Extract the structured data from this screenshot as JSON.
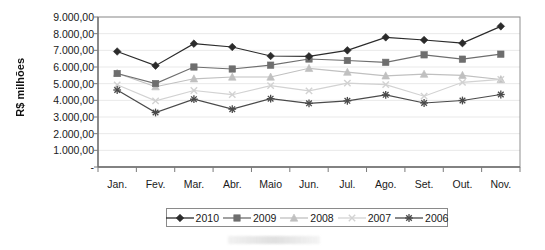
{
  "chart_data": {
    "type": "line",
    "title": "",
    "xlabel": "",
    "ylabel": "R$ milhões",
    "ylim": [
      0,
      9000
    ],
    "ytick_values": [
      0,
      1000,
      2000,
      3000,
      4000,
      5000,
      6000,
      7000,
      8000,
      9000
    ],
    "ytick_labels": [
      "-",
      "1.000,00",
      "2.000,00",
      "3.000,00",
      "4.000,00",
      "5.000,00",
      "6.000,00",
      "7.000,00",
      "8.000,00",
      "9.000,00"
    ],
    "categories": [
      "Jan.",
      "Fev.",
      "Mar.",
      "Abr.",
      "Maio",
      "Jun.",
      "Jul.",
      "Ago.",
      "Set.",
      "Out.",
      "Nov."
    ],
    "grid": true,
    "legend_position": "bottom",
    "series": [
      {
        "name": "2010",
        "marker": "diamond",
        "color": "#2b2b2b",
        "values": [
          6930,
          6080,
          7400,
          7200,
          6660,
          6640,
          7000,
          7780,
          7620,
          7430,
          8440
        ]
      },
      {
        "name": "2009",
        "marker": "square",
        "color": "#6e6e6e",
        "values": [
          5610,
          5010,
          6000,
          5880,
          6110,
          6480,
          6390,
          6280,
          6730,
          6470,
          6770
        ]
      },
      {
        "name": "2008",
        "marker": "triangle",
        "color": "#c0c0c0",
        "values": [
          5630,
          4820,
          5290,
          5400,
          5400,
          5920,
          5690,
          5470,
          5570,
          5500,
          5250
        ]
      },
      {
        "name": "2007",
        "marker": "x",
        "color": "#d2d2d2",
        "values": [
          4930,
          3970,
          4590,
          4340,
          4880,
          4570,
          5030,
          4940,
          4250,
          5080,
          5260
        ]
      },
      {
        "name": "2006",
        "marker": "asterisk",
        "color": "#4a4a4a",
        "values": [
          4620,
          3270,
          4070,
          3470,
          4100,
          3820,
          3970,
          4330,
          3840,
          3990,
          4350
        ]
      }
    ]
  },
  "legend": {
    "items": [
      {
        "label": "2010"
      },
      {
        "label": "2009"
      },
      {
        "label": "2008"
      },
      {
        "label": "2007"
      },
      {
        "label": "2006"
      }
    ]
  }
}
